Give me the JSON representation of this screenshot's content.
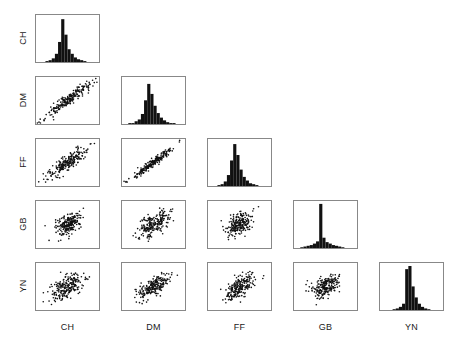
{
  "figure": {
    "title": "",
    "type": "scatter-plot-matrix",
    "variables": [
      "CH",
      "DM",
      "FF",
      "GB",
      "YN"
    ],
    "diagonal": "histogram",
    "triangle": "lower",
    "background": "#ffffff",
    "marker_color": "#111111",
    "border_color": "#888888"
  },
  "row_labels": [
    "CH",
    "DM",
    "FF",
    "GB",
    "YN"
  ],
  "col_labels": [
    "CH",
    "DM",
    "FF",
    "GB",
    "YN"
  ],
  "chart_data": {
    "type": "scatter",
    "title": "",
    "xlabel": "",
    "ylabel": "",
    "variables": [
      "CH",
      "DM",
      "FF",
      "GB",
      "YN"
    ],
    "layout": "lower-triangular 5x5 matrix with histograms on diagonal",
    "grid": false,
    "legend": "none",
    "axis_ticks": "none",
    "panels": [
      {
        "row": 0,
        "col": 0,
        "kind": "histogram",
        "var": "CH",
        "bins": [
          0,
          0,
          0,
          1,
          2,
          4,
          9,
          22,
          47,
          30,
          14,
          9,
          5,
          3,
          2,
          1,
          0,
          0,
          0,
          0
        ],
        "ylim": [
          0,
          50
        ]
      },
      {
        "row": 1,
        "col": 0,
        "kind": "scatter",
        "x": "CH",
        "y": "DM",
        "r": 0.93
      },
      {
        "row": 1,
        "col": 1,
        "kind": "histogram",
        "var": "DM",
        "bins": [
          0,
          0,
          1,
          1,
          3,
          5,
          11,
          26,
          44,
          33,
          20,
          12,
          7,
          4,
          2,
          1,
          1,
          0,
          0,
          0
        ],
        "ylim": [
          0,
          50
        ]
      },
      {
        "row": 2,
        "col": 0,
        "kind": "scatter",
        "x": "CH",
        "y": "FF",
        "r": 0.88
      },
      {
        "row": 2,
        "col": 1,
        "kind": "scatter",
        "x": "DM",
        "y": "FF",
        "r": 0.97
      },
      {
        "row": 2,
        "col": 2,
        "kind": "histogram",
        "var": "FF",
        "bins": [
          0,
          0,
          0,
          1,
          2,
          5,
          12,
          28,
          46,
          34,
          18,
          10,
          6,
          3,
          2,
          1,
          0,
          0,
          0,
          0
        ],
        "ylim": [
          0,
          50
        ]
      },
      {
        "row": 3,
        "col": 0,
        "kind": "scatter",
        "x": "CH",
        "y": "GB",
        "r": 0.42
      },
      {
        "row": 3,
        "col": 1,
        "kind": "scatter",
        "x": "DM",
        "y": "GB",
        "r": 0.6
      },
      {
        "row": 3,
        "col": 2,
        "kind": "scatter",
        "x": "FF",
        "y": "GB",
        "r": 0.45
      },
      {
        "row": 3,
        "col": 3,
        "kind": "histogram",
        "var": "GB",
        "bins": [
          0,
          0,
          1,
          2,
          3,
          4,
          6,
          9,
          60,
          14,
          8,
          6,
          4,
          3,
          2,
          1,
          0,
          0,
          0,
          0
        ],
        "ylim": [
          0,
          62
        ]
      },
      {
        "row": 4,
        "col": 0,
        "kind": "scatter",
        "x": "CH",
        "y": "YN",
        "r": 0.55
      },
      {
        "row": 4,
        "col": 1,
        "kind": "scatter",
        "x": "DM",
        "y": "YN",
        "r": 0.66
      },
      {
        "row": 4,
        "col": 2,
        "kind": "scatter",
        "x": "FF",
        "y": "YN",
        "r": 0.62
      },
      {
        "row": 4,
        "col": 3,
        "kind": "scatter",
        "x": "GB",
        "y": "YN",
        "r": 0.38
      },
      {
        "row": 4,
        "col": 4,
        "kind": "histogram",
        "var": "YN",
        "bins": [
          0,
          0,
          0,
          0,
          1,
          2,
          4,
          8,
          52,
          56,
          30,
          16,
          8,
          4,
          2,
          1,
          0,
          0,
          0,
          0
        ],
        "ylim": [
          0,
          58
        ]
      }
    ],
    "n_points": 220,
    "geometry": {
      "origin_x": 35,
      "origin_y": 14,
      "panel_w": 65,
      "panel_h": 49,
      "col_pitch": 86,
      "row_pitch": 62
    }
  }
}
